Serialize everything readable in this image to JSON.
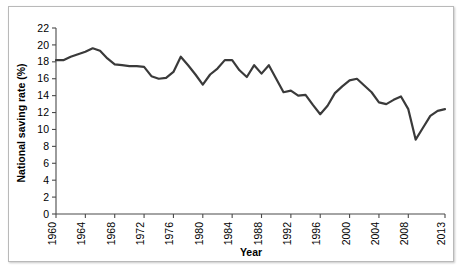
{
  "chart_data": {
    "type": "line",
    "title": "",
    "xlabel": "Year",
    "ylabel": "National saving rate (%)",
    "xlim": [
      1960,
      2013
    ],
    "ylim": [
      0,
      22
    ],
    "ytick_step": 2,
    "yticks": [
      0,
      2,
      4,
      6,
      8,
      10,
      12,
      14,
      16,
      18,
      20,
      22
    ],
    "xticks": [
      1960,
      1964,
      1968,
      1972,
      1976,
      1980,
      1984,
      1988,
      1992,
      1996,
      2000,
      2004,
      2008,
      2013
    ],
    "xtick_labels": [
      "1960",
      "1964",
      "1968",
      "1972",
      "1976",
      "1980",
      "1984",
      "1988",
      "1992",
      "1996",
      "2000",
      "2004",
      "2008",
      "2013"
    ],
    "xtick_rotation": 90,
    "grid": false,
    "legend": false,
    "line_color": "#3a3a3a",
    "line_width": 2.2,
    "x": [
      1960,
      1961,
      1962,
      1963,
      1964,
      1965,
      1966,
      1967,
      1968,
      1969,
      1970,
      1971,
      1972,
      1973,
      1974,
      1975,
      1976,
      1977,
      1978,
      1979,
      1980,
      1981,
      1982,
      1983,
      1984,
      1985,
      1986,
      1987,
      1988,
      1989,
      1990,
      1991,
      1992,
      1993,
      1994,
      1995,
      1996,
      1997,
      1998,
      1999,
      2000,
      2001,
      2002,
      2003,
      2004,
      2005,
      2006,
      2007,
      2008,
      2009,
      2010,
      2011,
      2012,
      2013
    ],
    "values": [
      18.2,
      18.2,
      18.6,
      18.9,
      19.2,
      19.6,
      19.3,
      18.4,
      17.7,
      17.6,
      17.5,
      17.5,
      17.4,
      16.3,
      16.0,
      16.1,
      16.8,
      18.6,
      17.6,
      16.5,
      15.3,
      16.5,
      17.2,
      18.2,
      18.2,
      17.0,
      16.2,
      17.6,
      16.6,
      17.6,
      16.0,
      14.4,
      14.6,
      14.0,
      14.1,
      12.9,
      11.8,
      12.8,
      14.3,
      15.1,
      15.8,
      16.0,
      15.2,
      14.4,
      13.2,
      13.0,
      13.5,
      13.9,
      12.4,
      8.8,
      10.2,
      11.6,
      12.2,
      12.4
    ]
  }
}
